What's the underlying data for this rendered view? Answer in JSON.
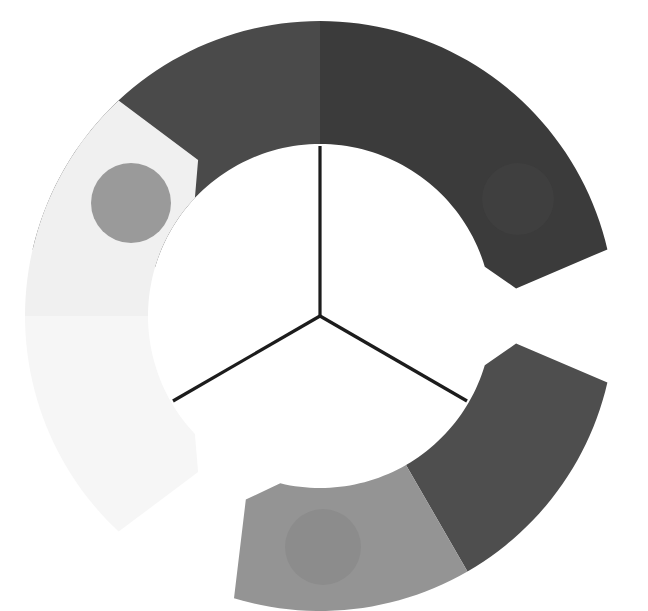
{
  "canvas": {
    "width": 648,
    "height": 611,
    "background": "#ffffff",
    "title": "Three-segment radial ring diagram"
  },
  "hub": {
    "name": "center-hub",
    "center_x": 320,
    "center_y": 316,
    "spoke_color": "#1c1c1c",
    "spoke_width": 3.2,
    "spoke_inner_radius": 0,
    "spoke_outer_radius": 170,
    "spokes": [
      {
        "label": "spoke-up",
        "angle_deg": 270,
        "end_x": 320,
        "end_y": 146
      },
      {
        "label": "spoke-lower-left",
        "angle_deg": 150,
        "end_x": 173,
        "end_y": 401
      },
      {
        "label": "spoke-lower-right",
        "angle_deg": 30,
        "end_x": 467,
        "end_y": 401
      }
    ]
  },
  "ring": {
    "name": "segmented-ring",
    "inner_radius": 172,
    "outer_radius": 295,
    "chamfer": 26,
    "gap_deg": 16,
    "segments": [
      {
        "id": "segment-top",
        "name": "top-arc-segment",
        "start_deg": 188,
        "end_deg": 352,
        "halves": [
          {
            "id": "top-left-half",
            "color": "#4a4a4a",
            "start_deg": 188,
            "end_deg": 270
          },
          {
            "id": "top-right-half",
            "color": "#3b3b3b",
            "start_deg": 270,
            "end_deg": 352
          }
        ]
      },
      {
        "id": "segment-lower-right",
        "name": "lower-right-arc-segment",
        "start_deg": 8,
        "end_deg": 112,
        "halves": [
          {
            "id": "lower-right-upper-half",
            "color": "#4e4e4e",
            "start_deg": 8,
            "end_deg": 60
          },
          {
            "id": "lower-right-lower-half",
            "color": "#949494",
            "start_deg": 60,
            "end_deg": 112
          }
        ]
      },
      {
        "id": "segment-lower-left",
        "name": "lower-left-arc-segment",
        "start_deg": 128,
        "end_deg": 232,
        "halves": [
          {
            "id": "lower-left-lower-half",
            "color": "#f6f6f6",
            "start_deg": 128,
            "end_deg": 180
          },
          {
            "id": "lower-left-upper-half",
            "color": "#f0f0f0",
            "start_deg": 180,
            "end_deg": 232
          }
        ]
      }
    ]
  },
  "nodes": [
    {
      "id": "node-left",
      "name": "node-circle-left",
      "cx": 131,
      "cy": 203,
      "r": 40,
      "color": "#9a9a9a"
    },
    {
      "id": "node-right",
      "name": "node-circle-right",
      "cx": 518,
      "cy": 199,
      "r": 36,
      "color": "#3f3f3f"
    },
    {
      "id": "node-bottom",
      "name": "node-circle-bottom",
      "cx": 323,
      "cy": 547,
      "r": 38,
      "color": "#8c8c8c"
    }
  ]
}
